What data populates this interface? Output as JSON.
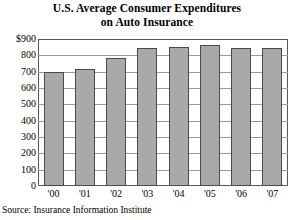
{
  "chart_data": {
    "type": "bar",
    "title": "U.S. Average Consumer Expenditures on Auto Insurance",
    "title_lines": [
      "U.S. Average Consumer Expenditures",
      "on Auto Insurance"
    ],
    "categories": [
      "'00",
      "'01",
      "'02",
      "'03",
      "'04",
      "'05",
      "'06",
      "'07"
    ],
    "values": [
      700,
      715,
      785,
      845,
      850,
      865,
      845,
      843
    ],
    "xlabel": "",
    "ylabel": "",
    "ylim": [
      0,
      900
    ],
    "ytick_values": [
      900,
      800,
      700,
      600,
      500,
      400,
      300,
      200,
      100,
      0
    ],
    "ytick_labels": [
      "$900",
      "800",
      "700",
      "600",
      "500",
      "400",
      "300",
      "200",
      "100",
      "0"
    ],
    "grid": true,
    "legend": false,
    "bar_color": "#a9a9a9",
    "bar_edge_color": "#4a4a4a",
    "gridline_color": "#9a9a9a",
    "frame_color": "#595959",
    "source": "Source: Insurance Information Institute"
  }
}
